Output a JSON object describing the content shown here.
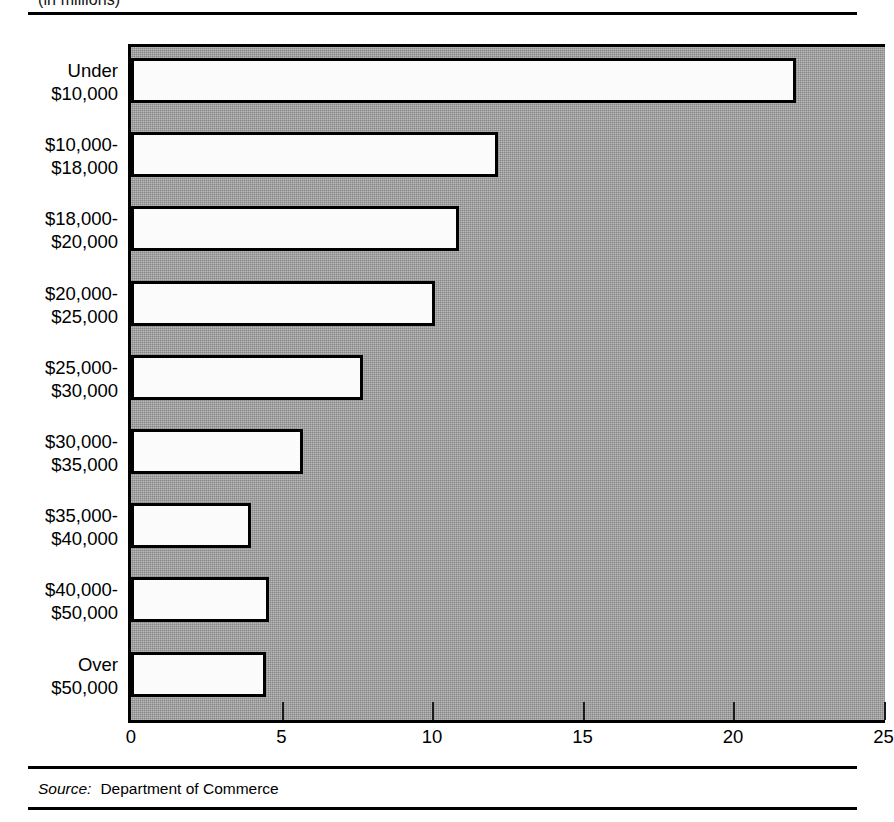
{
  "figure": {
    "subtitle": "(in millions)",
    "source_label": "Source:",
    "source_value": "Department of Commerce"
  },
  "colors": {
    "plot_background": "#9b9b9b",
    "bar_fill": "#fbfbfb",
    "bar_outline": "#000000",
    "axis": "#000000",
    "text": "#000000"
  },
  "chart_data": {
    "type": "bar",
    "orientation": "horizontal",
    "title": "",
    "subtitle": "(in millions)",
    "xlabel": "",
    "ylabel": "",
    "xlim": [
      0,
      25
    ],
    "xticks": [
      0,
      5,
      10,
      15,
      20,
      25
    ],
    "xtick_labels": [
      "0",
      "5",
      "10",
      "15",
      "20",
      "25"
    ],
    "grid": false,
    "legend": false,
    "source": "Department of Commerce",
    "categories": [
      "Under $10,000",
      "$10,000-$18,000",
      "$18,000-$20,000",
      "$20,000-$25,000",
      "$25,000-$30,000",
      "$30,000-$35,000",
      "$35,000-$40,000",
      "$40,000-$50,000",
      "Over $50,000"
    ],
    "category_lines": [
      [
        "Under",
        "$10,000"
      ],
      [
        "$10,000-",
        "$18,000"
      ],
      [
        "$18,000-",
        "$20,000"
      ],
      [
        "$20,000-",
        "$25,000"
      ],
      [
        "$25,000-",
        "$30,000"
      ],
      [
        "$30,000-",
        "$35,000"
      ],
      [
        "$35,000-",
        "$40,000"
      ],
      [
        "$40,000-",
        "$50,000"
      ],
      [
        "Over",
        "$50,000"
      ]
    ],
    "values": [
      22.1,
      12.2,
      10.9,
      10.1,
      7.7,
      5.7,
      4.0,
      4.6,
      4.5
    ]
  }
}
